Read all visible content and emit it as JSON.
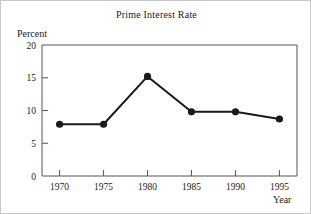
{
  "chart_data": {
    "type": "line",
    "title": "Prime Interest Rate",
    "xlabel": "Year",
    "ylabel": "Percent",
    "categories": [
      1970,
      1975,
      1980,
      1985,
      1990,
      1995
    ],
    "x": [
      1970,
      1975,
      1980,
      1985,
      1990,
      1995
    ],
    "values": [
      7.9,
      7.9,
      15.2,
      9.8,
      9.8,
      8.7
    ],
    "series": [
      {
        "name": "Prime Interest Rate",
        "values": [
          7.9,
          7.9,
          15.2,
          9.8,
          9.8,
          8.7
        ]
      }
    ],
    "xlim": [
      1968,
      1997
    ],
    "ylim": [
      0,
      20
    ],
    "xticks": [
      "1970",
      "1975",
      "1980",
      "1985",
      "1990",
      "1995"
    ],
    "yticks": [
      "0",
      "5",
      "10",
      "15",
      "20"
    ],
    "ytick_values": [
      0,
      5,
      10,
      15,
      20
    ],
    "grid": false,
    "legend": "none",
    "marker": "filled-circle",
    "line_color": "#1a1a1a",
    "marker_color": "#1a1a1a",
    "axis_color": "#555555",
    "background_color": "#ffffff"
  }
}
